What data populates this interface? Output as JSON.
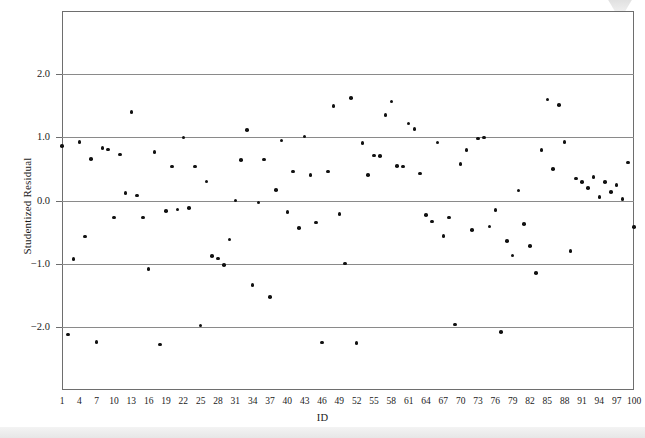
{
  "figure": {
    "background": "#ffffff",
    "frame_color": "#6e6e6e",
    "grid_color": "#8a8a8a",
    "marker_color": "#111111",
    "caption_partial": ""
  },
  "chart_data": {
    "type": "scatter",
    "title": "",
    "xlabel": "ID",
    "ylabel": "Studentized Residual",
    "xlim": [
      1,
      100
    ],
    "ylim": [
      -3.0,
      3.0
    ],
    "grid": true,
    "legend": false,
    "xticks": [
      1,
      4,
      7,
      10,
      13,
      16,
      19,
      22,
      25,
      28,
      31,
      34,
      37,
      40,
      43,
      46,
      49,
      52,
      55,
      58,
      61,
      64,
      67,
      70,
      73,
      76,
      79,
      82,
      85,
      88,
      91,
      94,
      97,
      100
    ],
    "xtick_labels": [
      "1",
      "4",
      "7",
      "10",
      "13",
      "16",
      "19",
      "22",
      "25",
      "28",
      "31",
      "34",
      "37",
      "40",
      "43",
      "46",
      "49",
      "52",
      "55",
      "58",
      "61",
      "64",
      "67",
      "70",
      "73",
      "76",
      "79",
      "82",
      "85",
      "88",
      "91",
      "94",
      "97",
      "100"
    ],
    "yticks": [
      2.0,
      1.0,
      0.0,
      -1.0,
      -2.0
    ],
    "ytick_labels": [
      "2.0",
      "1.0",
      "0.0",
      "-1.0",
      "-2.0"
    ],
    "gridline_values": [
      2.0,
      1.0,
      0.0,
      -1.0,
      -2.0
    ],
    "x": [
      1,
      2,
      3,
      4,
      5,
      6,
      7,
      8,
      9,
      10,
      11,
      12,
      13,
      14,
      15,
      16,
      17,
      18,
      19,
      20,
      21,
      22,
      23,
      24,
      25,
      26,
      27,
      28,
      29,
      30,
      31,
      32,
      33,
      34,
      35,
      36,
      37,
      38,
      39,
      40,
      41,
      42,
      43,
      44,
      45,
      46,
      47,
      48,
      49,
      50,
      51,
      52,
      53,
      54,
      55,
      56,
      57,
      58,
      59,
      60,
      61,
      62,
      63,
      64,
      65,
      66,
      67,
      68,
      69,
      70,
      71,
      72,
      73,
      74,
      75,
      76,
      77,
      78,
      79,
      80,
      81,
      82,
      83,
      84,
      85,
      86,
      87,
      88,
      89,
      90,
      91,
      92,
      93,
      94,
      95,
      96,
      97,
      98,
      99,
      100
    ],
    "y": [
      0.86,
      -2.12,
      -0.93,
      0.93,
      -0.57,
      0.66,
      -2.24,
      0.83,
      0.81,
      -0.27,
      0.73,
      0.12,
      1.4,
      0.08,
      -0.27,
      -1.08,
      0.77,
      -2.28,
      -0.17,
      0.54,
      -0.14,
      1.0,
      -0.12,
      0.54,
      -1.98,
      0.3,
      -0.88,
      -0.92,
      -1.02,
      -0.62,
      0.0,
      0.64,
      1.12,
      -1.34,
      -0.03,
      0.65,
      -1.53,
      0.17,
      0.95,
      -0.18,
      0.46,
      -0.44,
      1.01,
      0.4,
      -0.35,
      -2.25,
      0.46,
      1.5,
      -0.21,
      -1.0,
      1.62,
      -2.26,
      0.91,
      0.4,
      0.71,
      0.7,
      1.35,
      1.57,
      0.55,
      0.54,
      1.22,
      1.13,
      0.43,
      -0.23,
      -0.33,
      0.92,
      -0.56,
      -0.27,
      -1.96,
      0.58,
      0.8,
      -0.47,
      0.98,
      1.0,
      -0.41,
      -0.15,
      -2.08,
      -0.64,
      -0.87,
      0.16,
      -0.37,
      -0.72,
      -1.15,
      0.8,
      1.6,
      0.5,
      1.51,
      0.93,
      -0.8,
      0.35,
      0.29,
      0.2,
      0.37,
      0.06,
      0.29,
      0.13,
      0.25,
      0.02,
      0.6,
      -0.42
    ]
  }
}
